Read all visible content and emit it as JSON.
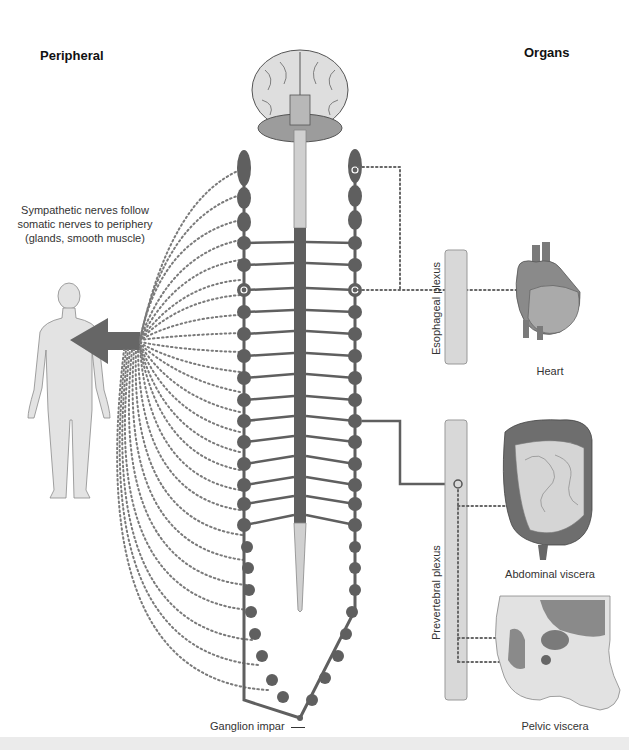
{
  "headings": {
    "left": "Peripheral",
    "right": "Organs"
  },
  "annotations": {
    "sympathetic_note_line1": "Sympathetic nerves follow",
    "sympathetic_note_line2": "somatic nerves to periphery",
    "sympathetic_note_line3": "(glands, smooth muscle)",
    "ganglion_impar": "Ganglion impar"
  },
  "plexuses": {
    "esophageal": "Esophageal plexus",
    "prevertebral": "Prevertebral plexus"
  },
  "organs": {
    "heart": "Heart",
    "abdominal": "Abdominal viscera",
    "pelvic": "Pelvic viscera"
  },
  "colors": {
    "chain": "#5f5f5f",
    "cord_upper": "#cfcfcf",
    "cord_lower": "#5f5f5f",
    "plexus_bar": "#d6d6d6",
    "body": "#e2e2e2",
    "organ_fill": "#9a9a9a",
    "dots": "#777777"
  }
}
